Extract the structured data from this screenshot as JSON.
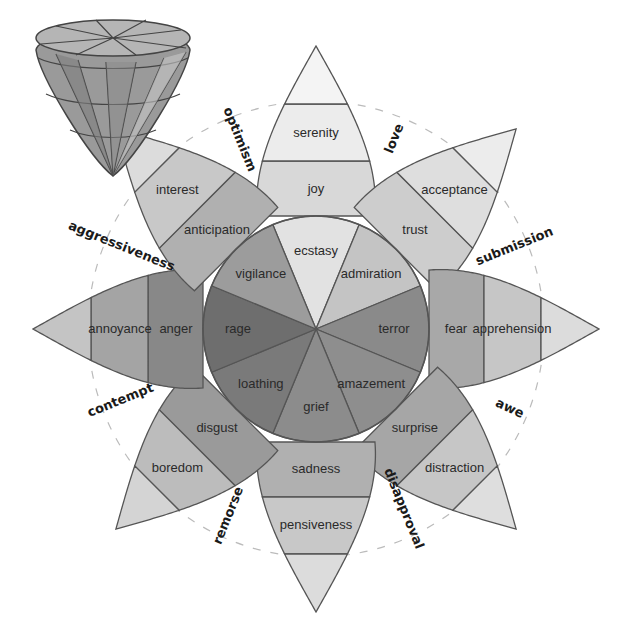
{
  "center": [
    316,
    329
  ],
  "radii": {
    "tip": 283,
    "band_outer": 225,
    "band_mid": 168,
    "inner_circle": 113,
    "dashed_circle": 228
  },
  "petals": [
    {
      "angle": -90,
      "intense": "ecstasy",
      "basic": "joy",
      "mild": "serenity",
      "shades": [
        "#e2e2e2",
        "#d8d8d8",
        "#ececec",
        "#f4f4f4"
      ]
    },
    {
      "angle": -45,
      "intense": "admiration",
      "basic": "trust",
      "mild": "acceptance",
      "shades": [
        "#c4c4c4",
        "#cdcdcd",
        "#dedede",
        "#ececec"
      ]
    },
    {
      "angle": 0,
      "intense": "terror",
      "basic": "fear",
      "mild": "apprehension",
      "shades": [
        "#8a8a8a",
        "#a8a8a8",
        "#c6c6c6",
        "#dcdcdc"
      ]
    },
    {
      "angle": 45,
      "intense": "amazement",
      "basic": "surprise",
      "mild": "distraction",
      "shades": [
        "#8e8e8e",
        "#a6a6a6",
        "#c6c6c6",
        "#dedede"
      ]
    },
    {
      "angle": 90,
      "intense": "grief",
      "basic": "sadness",
      "mild": "pensiveness",
      "shades": [
        "#8c8c8c",
        "#b0b0b0",
        "#c8c8c8",
        "#dcdcdc"
      ]
    },
    {
      "angle": 135,
      "intense": "loathing",
      "basic": "disgust",
      "mild": "boredom",
      "shades": [
        "#7a7a7a",
        "#9a9a9a",
        "#bcbcbc",
        "#d4d4d4"
      ]
    },
    {
      "angle": 180,
      "intense": "rage",
      "basic": "anger",
      "mild": "annoyance",
      "shades": [
        "#6e6e6e",
        "#888888",
        "#a4a4a4",
        "#c4c4c4"
      ]
    },
    {
      "angle": -135,
      "intense": "vigilance",
      "basic": "anticipation",
      "mild": "interest",
      "shades": [
        "#9c9c9c",
        "#b0b0b0",
        "#c8c8c8",
        "#dcdcdc"
      ]
    }
  ],
  "dyads": [
    {
      "label": "love",
      "x": 398,
      "y": 140,
      "rotate": -68
    },
    {
      "label": "submission",
      "x": 516,
      "y": 250,
      "rotate": -22
    },
    {
      "label": "awe",
      "x": 508,
      "y": 412,
      "rotate": 25
    },
    {
      "label": "disapproval",
      "x": 400,
      "y": 510,
      "rotate": 68
    },
    {
      "label": "remorse",
      "x": 232,
      "y": 517,
      "rotate": -68
    },
    {
      "label": "contempt",
      "x": 122,
      "y": 404,
      "rotate": -22
    },
    {
      "label": "aggressiveness",
      "x": 120,
      "y": 250,
      "rotate": 22
    },
    {
      "label": "optimism",
      "x": 236,
      "y": 141,
      "rotate": 68
    }
  ],
  "cone": {
    "label": "3D emotion cone model"
  },
  "outline_color": "#555555"
}
